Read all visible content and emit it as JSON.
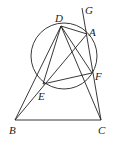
{
  "diagram": {
    "type": "geometry",
    "points": {
      "A": {
        "x": 87,
        "y": 34,
        "label": "A",
        "lx": 90,
        "ly": 34
      },
      "B": {
        "x": 15,
        "y": 120,
        "label": "B",
        "lx": 9,
        "ly": 134
      },
      "C": {
        "x": 101,
        "y": 120,
        "label": "C",
        "lx": 99,
        "ly": 134
      },
      "D": {
        "x": 61,
        "y": 26,
        "label": "D",
        "lx": 55,
        "ly": 22
      },
      "E": {
        "x": 43,
        "y": 84,
        "label": "E",
        "lx": 38,
        "ly": 100
      },
      "F": {
        "x": 92,
        "y": 73,
        "label": "F",
        "lx": 96,
        "ly": 79
      },
      "G": {
        "x": 82,
        "y": 8,
        "label": "G",
        "lx": 85,
        "ly": 14
      }
    },
    "circle": {
      "cx": 64,
      "cy": 56,
      "r": 33
    },
    "segments": [
      [
        "D",
        "A"
      ],
      [
        "D",
        "E"
      ],
      [
        "D",
        "F"
      ],
      [
        "D",
        "B"
      ],
      [
        "D",
        "C"
      ],
      [
        "E",
        "F"
      ],
      [
        "E",
        "A"
      ],
      [
        "B",
        "A"
      ],
      [
        "B",
        "C"
      ],
      [
        "G",
        "C"
      ],
      [
        "A",
        "F"
      ]
    ]
  }
}
